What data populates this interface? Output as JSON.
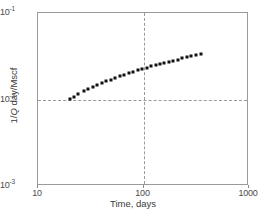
{
  "chart_data": {
    "type": "scatter",
    "title": "",
    "xlabel": "Time, days",
    "ylabel": "1/Q day/Mscf",
    "ylabel_parts": {
      "pre": "1/",
      "italic": "Q",
      "post": " day/Mscf"
    },
    "xscale": "log",
    "yscale": "log",
    "xlim": [
      10,
      1000
    ],
    "ylim": [
      0.001,
      0.1
    ],
    "grid": false,
    "legend": null,
    "xticks": [
      {
        "value": 10,
        "label": "10"
      },
      {
        "value": 100,
        "label": "100"
      },
      {
        "value": 1000,
        "label": "1000"
      }
    ],
    "yticks": [
      {
        "value": 0.1,
        "mantissa": "10",
        "exponent": "-1"
      },
      {
        "value": 0.01,
        "mantissa": "10",
        "exponent": "-2"
      },
      {
        "value": 0.001,
        "mantissa": "10",
        "exponent": "-3"
      }
    ],
    "reference_lines": [
      {
        "orientation": "vertical",
        "value": 100,
        "style": "dashed",
        "color": "#9a9a9a"
      },
      {
        "orientation": "horizontal",
        "value": 0.01,
        "style": "dashed",
        "color": "#9a9a9a"
      }
    ],
    "marker": {
      "shape": "square",
      "size": 3,
      "color": "#111111"
    },
    "series": [
      {
        "name": "1/Q vs time",
        "x": [
          20,
          22,
          24,
          27,
          30,
          33,
          36,
          40,
          44,
          49,
          54,
          60,
          66,
          73,
          80,
          88,
          97,
          107,
          118,
          130,
          143,
          158,
          174,
          192,
          212,
          234,
          258,
          285,
          315,
          348
        ],
        "y": [
          0.0101,
          0.0108,
          0.0115,
          0.0124,
          0.0132,
          0.0139,
          0.0146,
          0.0154,
          0.0162,
          0.017,
          0.0178,
          0.0186,
          0.0194,
          0.0202,
          0.0209,
          0.0217,
          0.0225,
          0.0233,
          0.0241,
          0.0249,
          0.0257,
          0.0265,
          0.0273,
          0.0281,
          0.029,
          0.0298,
          0.0307,
          0.0316,
          0.0325,
          0.0334
        ]
      }
    ]
  }
}
